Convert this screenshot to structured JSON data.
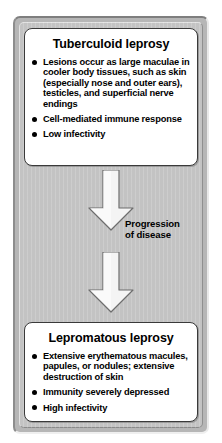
{
  "figure": {
    "background_color": "#c3c3c3",
    "card_color": "#ffffff",
    "arrow_color": "#f2f2f2",
    "text_color": "#000000"
  },
  "boxes": [
    {
      "id": "tuberculoid",
      "title": "Tuberculoid leprosy",
      "bullets": [
        "Lesions occur as large maculae in cooler body tissues, such as skin (especially nose and outer ears), testicles, and  superficial nerve endings",
        "Cell-mediated immune response",
        "Low infectivity"
      ]
    },
    {
      "id": "lepromatous",
      "title": "Lepromatous leprosy",
      "bullets": [
        "Extensive erythematous macules, papules, or nodules; extensive destruction of skin",
        "Immunity severely depressed",
        "High infectivity"
      ]
    }
  ],
  "connector": {
    "label_line1": "Progression",
    "label_line2": "of disease",
    "arrows": [
      {
        "name": "arrow-top",
        "direction": "down"
      },
      {
        "name": "arrow-bottom",
        "direction": "down"
      }
    ]
  }
}
